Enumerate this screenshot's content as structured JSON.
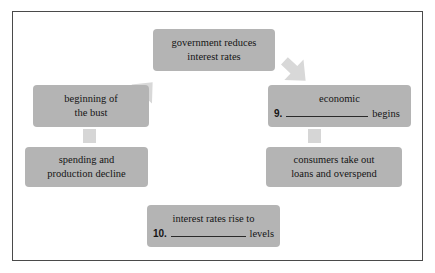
{
  "figure": {
    "kind": "cycle-diagram",
    "title": "",
    "node_fill": "#b4b4b4",
    "arrow_fill": "#d8d8d8",
    "border_color": "#4a4a4a",
    "background": "#ffffff",
    "text_color": "#141414"
  },
  "nodes": {
    "government": {
      "name": "government reduces interest rates",
      "line1": "government reduces",
      "line2": "interest rates"
    },
    "economic": {
      "name": "economic boom begins",
      "line1": "economic",
      "number": "9.",
      "blank": "",
      "tail": "begins"
    },
    "consumers": {
      "name": "consumers take out loans and overspend",
      "line1": "consumers take out",
      "line2": "loans and overspend"
    },
    "interest": {
      "name": "interest rates rise to levels",
      "line1": "interest rates rise to",
      "number": "10.",
      "blank": "",
      "tail": "levels"
    },
    "spending": {
      "name": "spending and production decline",
      "line1": "spending and",
      "line2": "production decline"
    },
    "beginning": {
      "name": "beginning of the bust",
      "line1": "beginning of",
      "line2": "the bust"
    }
  },
  "arrows": [
    {
      "id": "arrow-beginning-to-government",
      "direction": "up-right",
      "from": "beginning",
      "to": "government"
    },
    {
      "id": "arrow-government-to-economic",
      "direction": "down-right",
      "from": "government",
      "to": "economic"
    },
    {
      "id": "arrow-economic-to-consumers",
      "direction": "down",
      "from": "economic",
      "to": "consumers"
    },
    {
      "id": "arrow-consumers-to-interest",
      "direction": "down-left",
      "from": "consumers",
      "to": "interest"
    },
    {
      "id": "arrow-interest-to-spending",
      "direction": "up-left",
      "from": "interest",
      "to": "spending"
    },
    {
      "id": "arrow-spending-to-beginning",
      "direction": "up",
      "from": "spending",
      "to": "beginning"
    }
  ]
}
